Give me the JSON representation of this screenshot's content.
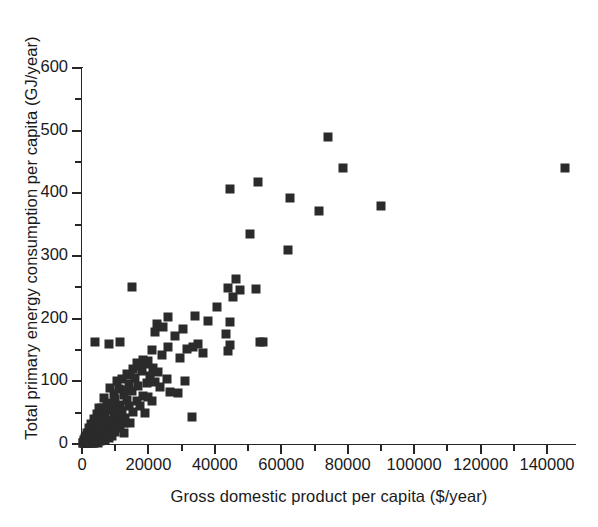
{
  "chart_data": {
    "type": "scatter",
    "title": "",
    "xlabel": "Gross domestic product per capita ($/year)",
    "ylabel": "Total primary energy consumption  per capita (GJ/year)",
    "xlim": [
      0,
      148000
    ],
    "ylim": [
      0,
      620
    ],
    "xticks": [
      0,
      20000,
      40000,
      60000,
      80000,
      100000,
      120000,
      140000
    ],
    "xtick_labels": [
      "0",
      "20000",
      "40000",
      "60000",
      "80000",
      "100000",
      "120000",
      "140000"
    ],
    "xminor_step": 10000,
    "yticks": [
      0,
      100,
      200,
      300,
      400,
      500,
      600
    ],
    "ytick_labels": [
      "0",
      "100",
      "200",
      "300",
      "400",
      "500",
      "600"
    ],
    "yminor_step": 50,
    "grid": false,
    "legend": null,
    "marker": "square",
    "marker_color": "#2b2b2b",
    "points": [
      [
        74000,
        490
      ],
      [
        78500,
        441
      ],
      [
        145500,
        440
      ],
      [
        53000,
        418
      ],
      [
        44500,
        407
      ],
      [
        62500,
        392
      ],
      [
        90000,
        380
      ],
      [
        71500,
        372
      ],
      [
        50500,
        335
      ],
      [
        62000,
        310
      ],
      [
        46500,
        263
      ],
      [
        15000,
        250
      ],
      [
        44000,
        249
      ],
      [
        52500,
        248
      ],
      [
        47500,
        246
      ],
      [
        45500,
        234
      ],
      [
        40500,
        218
      ],
      [
        34000,
        205
      ],
      [
        26000,
        202
      ],
      [
        38000,
        196
      ],
      [
        44500,
        194
      ],
      [
        22500,
        191
      ],
      [
        24500,
        187
      ],
      [
        30500,
        183
      ],
      [
        22000,
        178
      ],
      [
        43500,
        175
      ],
      [
        28000,
        172
      ],
      [
        4000,
        163
      ],
      [
        11500,
        163
      ],
      [
        8000,
        159
      ],
      [
        35000,
        160
      ],
      [
        53500,
        163
      ],
      [
        54500,
        162
      ],
      [
        44500,
        158
      ],
      [
        26000,
        155
      ],
      [
        33500,
        154
      ],
      [
        31500,
        152
      ],
      [
        21000,
        150
      ],
      [
        44000,
        148
      ],
      [
        36500,
        145
      ],
      [
        24000,
        142
      ],
      [
        29500,
        138
      ],
      [
        18500,
        134
      ],
      [
        20000,
        132
      ],
      [
        16500,
        130
      ],
      [
        19000,
        127
      ],
      [
        17500,
        124
      ],
      [
        21500,
        122
      ],
      [
        15500,
        119
      ],
      [
        18000,
        117
      ],
      [
        23000,
        115
      ],
      [
        13500,
        112
      ],
      [
        14500,
        110
      ],
      [
        20500,
        108
      ],
      [
        16000,
        106
      ],
      [
        12000,
        104
      ],
      [
        25500,
        103
      ],
      [
        31000,
        101
      ],
      [
        10500,
        100
      ],
      [
        22000,
        99
      ],
      [
        19500,
        97
      ],
      [
        14000,
        95
      ],
      [
        17000,
        93
      ],
      [
        23500,
        91
      ],
      [
        8500,
        90
      ],
      [
        11000,
        88
      ],
      [
        13000,
        86
      ],
      [
        15000,
        84
      ],
      [
        26500,
        83
      ],
      [
        29000,
        82
      ],
      [
        9500,
        80
      ],
      [
        12500,
        78
      ],
      [
        18500,
        77
      ],
      [
        20000,
        75
      ],
      [
        6500,
        74
      ],
      [
        10000,
        72
      ],
      [
        13500,
        70
      ],
      [
        16500,
        69
      ],
      [
        21000,
        68
      ],
      [
        7500,
        66
      ],
      [
        9000,
        64
      ],
      [
        11500,
        62
      ],
      [
        14000,
        61
      ],
      [
        17500,
        60
      ],
      [
        5000,
        58
      ],
      [
        6000,
        57
      ],
      [
        8000,
        55
      ],
      [
        10500,
        54
      ],
      [
        12000,
        52
      ],
      [
        15500,
        51
      ],
      [
        19000,
        50
      ],
      [
        4500,
        48
      ],
      [
        5500,
        47
      ],
      [
        7000,
        46
      ],
      [
        9500,
        45
      ],
      [
        11000,
        43
      ],
      [
        33000,
        43
      ],
      [
        13000,
        42
      ],
      [
        3500,
        40
      ],
      [
        4000,
        39
      ],
      [
        6000,
        38
      ],
      [
        7500,
        37
      ],
      [
        9000,
        36
      ],
      [
        10500,
        35
      ],
      [
        12500,
        34
      ],
      [
        14500,
        33
      ],
      [
        2800,
        32
      ],
      [
        3600,
        31
      ],
      [
        5000,
        30
      ],
      [
        6500,
        29
      ],
      [
        8000,
        28
      ],
      [
        9500,
        27
      ],
      [
        11500,
        26
      ],
      [
        2200,
        25
      ],
      [
        3000,
        24
      ],
      [
        4200,
        23
      ],
      [
        5500,
        22
      ],
      [
        7000,
        21
      ],
      [
        8500,
        20
      ],
      [
        10000,
        19
      ],
      [
        12500,
        18
      ],
      [
        1600,
        18
      ],
      [
        2400,
        17
      ],
      [
        3400,
        16
      ],
      [
        4600,
        15
      ],
      [
        6000,
        15
      ],
      [
        7500,
        14
      ],
      [
        9000,
        13
      ],
      [
        1200,
        13
      ],
      [
        2000,
        12
      ],
      [
        2800,
        12
      ],
      [
        3800,
        11
      ],
      [
        5000,
        11
      ],
      [
        6500,
        10
      ],
      [
        8000,
        10
      ],
      [
        900,
        9
      ],
      [
        1500,
        9
      ],
      [
        2200,
        8
      ],
      [
        3000,
        8
      ],
      [
        4000,
        7
      ],
      [
        5200,
        7
      ],
      [
        6800,
        6
      ],
      [
        700,
        6
      ],
      [
        1100,
        5
      ],
      [
        1700,
        5
      ],
      [
        2400,
        5
      ],
      [
        3200,
        4
      ],
      [
        4200,
        4
      ],
      [
        5500,
        4
      ],
      [
        500,
        3
      ],
      [
        900,
        3
      ],
      [
        1400,
        3
      ],
      [
        2000,
        3
      ],
      [
        2700,
        2
      ],
      [
        3600,
        2
      ],
      [
        4800,
        2
      ],
      [
        400,
        2
      ],
      [
        800,
        2
      ],
      [
        1300,
        1
      ],
      [
        1900,
        1
      ],
      [
        2600,
        1
      ],
      [
        3400,
        1
      ],
      [
        300,
        1
      ],
      [
        700,
        1
      ],
      [
        1200,
        1
      ],
      [
        1800,
        1
      ]
    ]
  }
}
